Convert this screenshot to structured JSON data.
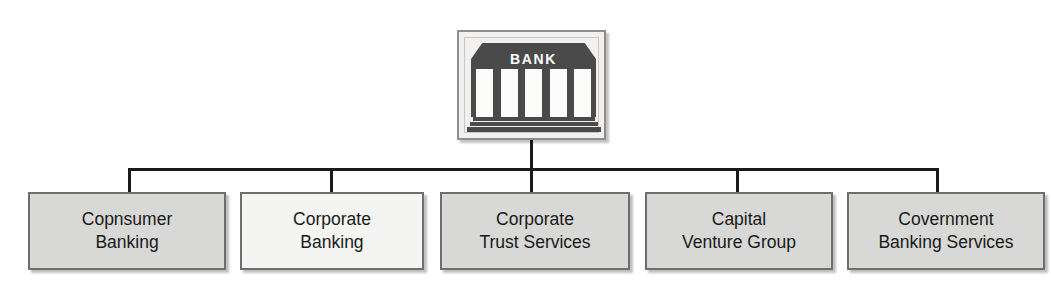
{
  "diagram": {
    "type": "organizational-chart",
    "orientation": "top-down",
    "root": {
      "icon_name": "bank-building-icon",
      "label": "BANK",
      "column_count": 5
    },
    "colors": {
      "line": "#1a1a1a",
      "box_border": "#6e6e6e",
      "box_fill_gray": "#d8d8d6",
      "box_fill_light": "#f4f4f2",
      "icon_dark": "#4a4a4a",
      "icon_frame": "#8d8d8d",
      "text": "#1a1a1a",
      "background": "#ffffff"
    },
    "nodes": [
      {
        "id": "consumer-banking",
        "label": "Copnsumer\nBanking",
        "fill": "#d8d8d6",
        "x": 28,
        "width": 198
      },
      {
        "id": "corporate-banking",
        "label": "Corporate\nBanking",
        "fill": "#f4f4f2",
        "x": 240,
        "width": 184
      },
      {
        "id": "corporate-trust-services",
        "label": "Corporate\nTrust Services",
        "fill": "#d8d8d6",
        "x": 440,
        "width": 190
      },
      {
        "id": "capital-venture-group",
        "label": "Capital\nVenture Group",
        "fill": "#d8d8d6",
        "x": 645,
        "width": 188
      },
      {
        "id": "government-banking-services",
        "label": "Covernment\nBanking Services",
        "fill": "#d8d8d6",
        "x": 847,
        "width": 198
      }
    ],
    "connectors": {
      "stem": {
        "x": 530,
        "top": 140,
        "bottom": 168
      },
      "bus": {
        "left": 128,
        "right": 936,
        "y": 168
      },
      "drops": [
        {
          "x": 128,
          "top": 168,
          "bottom": 192
        },
        {
          "x": 330,
          "top": 168,
          "bottom": 192
        },
        {
          "x": 530,
          "top": 168,
          "bottom": 192
        },
        {
          "x": 736,
          "top": 168,
          "bottom": 192
        },
        {
          "x": 936,
          "top": 168,
          "bottom": 192
        }
      ]
    }
  }
}
